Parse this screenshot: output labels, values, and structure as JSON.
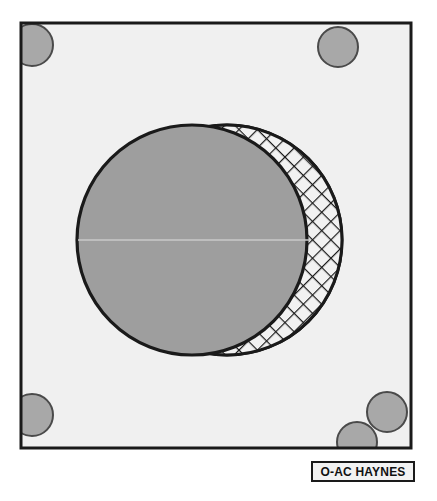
{
  "figure": {
    "caption_label": "O-AC HAYNES",
    "background_color": "#ffffff",
    "panel": {
      "name": "bounding-frame",
      "fill_color": "#f0f0f0",
      "stroke_color": "#1a1a1a",
      "stroke_width": 3,
      "x": 21,
      "y": 23,
      "width": 390,
      "height": 425
    },
    "solid_sphere": {
      "name": "solid-gray-sphere",
      "fill_color": "#9e9e9e",
      "stroke_color": "#1a1a1a",
      "stroke_width": 3,
      "cx": 192,
      "cy": 240,
      "r": 115
    },
    "mesh_sphere": {
      "name": "crosshatched-sphere",
      "fill_color": "#f0f0f0",
      "stroke_color": "#1a1a1a",
      "stroke_width": 3,
      "hatch_color": "#1a1a1a",
      "hatch_spacing": 13,
      "hatch_angle_deg": 45,
      "cx": 227,
      "cy": 240,
      "r": 115
    },
    "equator_line": {
      "name": "equator-highlight-line",
      "color": "#c9c9c9",
      "x1": 78,
      "x2": 310,
      "y": 240
    },
    "studs": [
      {
        "name": "stud-top-left",
        "cx": 32,
        "cy": 45,
        "r": 21,
        "fill_color": "#a8a8a8",
        "stroke_color": "#4a4a4a"
      },
      {
        "name": "stud-top-right",
        "cx": 338,
        "cy": 47,
        "r": 20,
        "fill_color": "#a8a8a8",
        "stroke_color": "#4a4a4a"
      },
      {
        "name": "stud-bottom-left",
        "cx": 32,
        "cy": 415,
        "r": 21,
        "fill_color": "#a8a8a8",
        "stroke_color": "#4a4a4a"
      },
      {
        "name": "stud-bottom-right-upper",
        "cx": 387,
        "cy": 412,
        "r": 20,
        "fill_color": "#a8a8a8",
        "stroke_color": "#4a4a4a"
      },
      {
        "name": "stud-bottom-right-lower",
        "cx": 357,
        "cy": 442,
        "r": 20,
        "fill_color": "#a8a8a8",
        "stroke_color": "#4a4a4a"
      }
    ]
  }
}
